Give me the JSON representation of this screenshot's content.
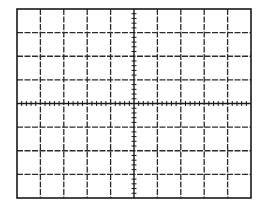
{
  "graticule": {
    "left": 17,
    "top": 9,
    "right": 251,
    "bottom": 198,
    "columns": 10,
    "rows": 8,
    "subdivisions_per_division": 5,
    "border_color": "#1a1a1a",
    "grid_color": "#2a2a2a",
    "axis_color": "#1a1a1a",
    "background": "#ffffff",
    "grid_style": "dashed",
    "center_axes_with_ticks": true
  }
}
